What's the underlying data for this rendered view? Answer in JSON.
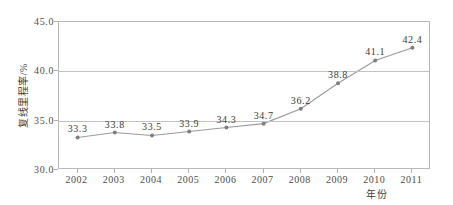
{
  "chart_data": {
    "type": "line",
    "title": "",
    "xlabel": "年份",
    "ylabel": "复线里程率/%",
    "categories": [
      "2002",
      "2003",
      "2004",
      "2005",
      "2006",
      "2007",
      "2008",
      "2009",
      "2010",
      "2011"
    ],
    "values": [
      33.3,
      33.8,
      33.5,
      33.9,
      34.3,
      34.7,
      36.2,
      38.8,
      41.1,
      42.4
    ],
    "point_labels": [
      "33.3",
      "33.8",
      "33.5",
      "33.9",
      "34.3",
      "34.7",
      "36.2",
      "38.8",
      "41.1",
      "42.4"
    ],
    "ylim": [
      30.0,
      45.0
    ],
    "yticks": [
      30.0,
      35.0,
      40.0,
      45.0
    ],
    "ytick_labels": [
      "30.0",
      "35.0",
      "40.0",
      "45.0"
    ],
    "grid": true,
    "grid_axis": "y",
    "legend": false,
    "legend_position": "none",
    "series": [
      {
        "name": "复线里程率",
        "values": [
          33.3,
          33.8,
          33.5,
          33.9,
          34.3,
          34.7,
          36.2,
          38.8,
          41.1,
          42.4
        ]
      }
    ],
    "colors": {
      "line": "#9a9a9a",
      "marker": "#7f7f7f",
      "grid": "#c2c2c2",
      "axis": "#b9b9b9",
      "text": "#3f3f3f",
      "background": "#ffffff"
    }
  }
}
